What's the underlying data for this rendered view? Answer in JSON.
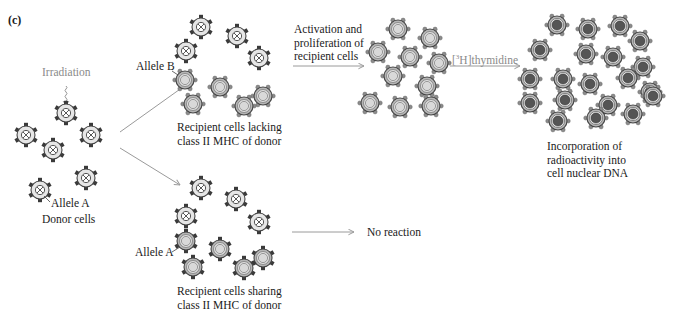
{
  "panel_label": "(c)",
  "labels": {
    "irradiation": "Irradiation",
    "allele_a_donor": "Allele A",
    "donor_cells": "Donor cells",
    "allele_b": "Allele B",
    "recipient_lacking_line1": "Recipient cells lacking",
    "recipient_lacking_line2": "class II MHC of donor",
    "allele_a_recipient": "Allele A",
    "recipient_sharing_line1": "Recipient cells sharing",
    "recipient_sharing_line2": "class II MHC of donor",
    "activation_line1": "Activation and",
    "activation_line2": "proliferation of",
    "activation_line3": "recipient cells",
    "thymidine_prefix": "[",
    "thymidine_sup": "3",
    "thymidine_suffix": "H]thymidine",
    "no_reaction": "No reaction",
    "incorporation_line1": "Incorporation of",
    "incorporation_line2": "radioactivity into",
    "incorporation_line3": "cell nuclear DNA"
  },
  "colors": {
    "text": "#1a1a1a",
    "gray_text": "#8a8a8a",
    "arrow": "#9a9a9a",
    "cell_outline": "#444444",
    "receptor_dark": "#3a3a3a",
    "receptor_gray": "#8c8c8c",
    "cell_fill_light": "#e6e6e6",
    "cell_fill_mid": "#b5b5b5",
    "nucleus_light": "#d9d9d9",
    "nucleus_radioactive": "#555555"
  },
  "cells": {
    "donor": [
      [
        66,
        113
      ],
      [
        26,
        135
      ],
      [
        91,
        135
      ],
      [
        53,
        150
      ],
      [
        86,
        178
      ],
      [
        40,
        190
      ]
    ],
    "top_recipient_x": [
      [
        201,
        27
      ],
      [
        237,
        36
      ],
      [
        186,
        51
      ],
      [
        259,
        58
      ]
    ],
    "top_recipient_ring": [
      [
        185,
        80
      ],
      [
        220,
        87
      ],
      [
        263,
        96
      ],
      [
        193,
        104
      ],
      [
        244,
        106
      ]
    ],
    "bottom_recipient_x": [
      [
        201,
        188
      ],
      [
        236,
        199
      ],
      [
        186,
        216
      ],
      [
        259,
        222
      ]
    ],
    "bottom_recipient_ring": [
      [
        186,
        241
      ],
      [
        220,
        249
      ],
      [
        263,
        258
      ],
      [
        193,
        267
      ],
      [
        244,
        268
      ]
    ],
    "activated": [
      [
        398,
        29
      ],
      [
        430,
        38
      ],
      [
        378,
        52
      ],
      [
        410,
        57
      ],
      [
        439,
        63
      ],
      [
        393,
        76
      ],
      [
        427,
        86
      ],
      [
        370,
        103
      ],
      [
        400,
        107
      ],
      [
        431,
        106
      ]
    ],
    "radioactive": [
      [
        557,
        25
      ],
      [
        588,
        29
      ],
      [
        620,
        26
      ],
      [
        640,
        41
      ],
      [
        540,
        50
      ],
      [
        586,
        54
      ],
      [
        613,
        57
      ],
      [
        643,
        67
      ],
      [
        530,
        79
      ],
      [
        563,
        79
      ],
      [
        590,
        84
      ],
      [
        628,
        78
      ],
      [
        650,
        92
      ],
      [
        530,
        103
      ],
      [
        565,
        100
      ],
      [
        608,
        105
      ],
      [
        653,
        96
      ],
      [
        558,
        121
      ],
      [
        596,
        118
      ],
      [
        633,
        114
      ]
    ]
  },
  "arrows": {
    "donor_to_top": [
      [
        120,
        132
      ],
      [
        190,
        82
      ]
    ],
    "donor_to_bottom": [
      [
        120,
        148
      ],
      [
        180,
        185
      ]
    ],
    "activation": [
      [
        293,
        66
      ],
      [
        364,
        66
      ]
    ],
    "thymidine": [
      [
        450,
        66
      ],
      [
        520,
        66
      ]
    ],
    "no_reaction": [
      [
        292,
        232
      ],
      [
        354,
        232
      ]
    ]
  }
}
